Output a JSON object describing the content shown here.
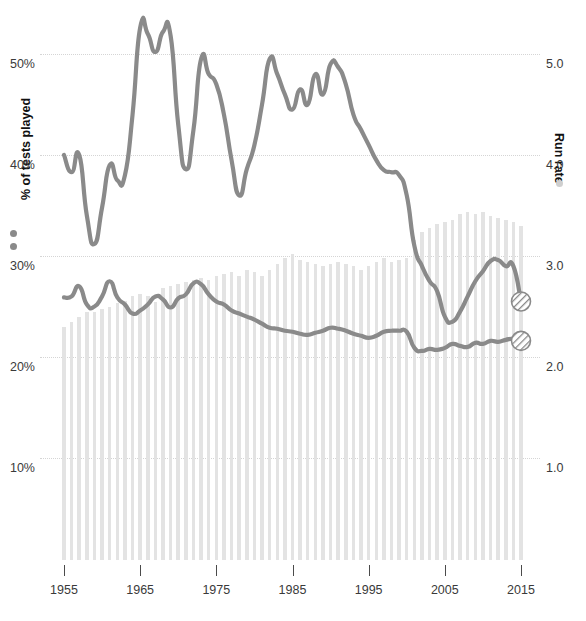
{
  "chart_data": {
    "type": "line",
    "title": "",
    "subtitle": "",
    "xlabel": "",
    "ylabel": "% of tests played",
    "y2label": "Run rate",
    "grid": true,
    "legend_position": "axis-titles",
    "xlim": [
      1955,
      2015
    ],
    "ylim": [
      5,
      55
    ],
    "y2lim": [
      0.5,
      5.4
    ],
    "x_ticks": [
      1955,
      1965,
      1975,
      1985,
      1995,
      2005,
      2015
    ],
    "x_tick_labels": [
      "1955",
      "1965",
      "1975",
      "1985",
      "1995",
      "2005",
      "2015"
    ],
    "y_ticks": [
      10,
      20,
      30,
      40,
      50
    ],
    "y_tick_labels": [
      "10%",
      "20%",
      "30%",
      "40%",
      "50%"
    ],
    "y2_ticks": [
      1.0,
      2.0,
      3.0,
      4.0,
      5.0
    ],
    "y2_tick_labels": [
      "1.0",
      "2.0",
      "3.0",
      "4.0",
      "5.0"
    ],
    "colors": {
      "line": "#8a8a8a",
      "bar": "#e3e3e3",
      "grid": "#d5d5d5",
      "text": "#3a3a3a",
      "axis_title": "#111111",
      "legend_dot_left": "#8a8a8a",
      "legend_dot_right": "#cfcfcf"
    },
    "x": [
      1955,
      1956,
      1957,
      1958,
      1959,
      1960,
      1961,
      1962,
      1963,
      1964,
      1965,
      1966,
      1967,
      1968,
      1969,
      1970,
      1971,
      1972,
      1973,
      1974,
      1975,
      1976,
      1977,
      1978,
      1979,
      1980,
      1981,
      1982,
      1983,
      1984,
      1985,
      1986,
      1987,
      1988,
      1989,
      1990,
      1991,
      1992,
      1993,
      1994,
      1995,
      1996,
      1997,
      1998,
      1999,
      2000,
      2001,
      2002,
      2003,
      2004,
      2005,
      2006,
      2007,
      2008,
      2009,
      2010,
      2011,
      2012,
      2013,
      2014,
      2015
    ],
    "series": [
      {
        "name": "% of tests played",
        "axis": "left",
        "type": "line",
        "unit": "%",
        "end_marker": true,
        "values": [
          40.0,
          38.3,
          40.0,
          34.0,
          31.2,
          34.8,
          39.0,
          37.5,
          38.0,
          44.0,
          52.6,
          52.0,
          50.2,
          52.2,
          51.8,
          43.0,
          38.6,
          42.5,
          49.5,
          48.0,
          47.0,
          44.0,
          39.5,
          36.0,
          38.6,
          41.0,
          45.0,
          49.5,
          48.0,
          46.0,
          44.5,
          46.5,
          45.0,
          48.0,
          46.0,
          49.0,
          48.7,
          47.0,
          44.0,
          42.5,
          41.0,
          39.5,
          38.5,
          38.3,
          38.0,
          36.0,
          31.0,
          29.0,
          27.5,
          26.5,
          24.0,
          23.5,
          24.5,
          26.0,
          27.5,
          28.5,
          29.5,
          29.6,
          29.0,
          29.0,
          25.5
        ]
      },
      {
        "name": "Run rate",
        "axis": "right",
        "type": "line",
        "unit": "runs/over",
        "end_marker": true,
        "values": [
          2.59,
          2.6,
          2.7,
          2.52,
          2.5,
          2.6,
          2.75,
          2.59,
          2.52,
          2.43,
          2.46,
          2.52,
          2.6,
          2.57,
          2.49,
          2.58,
          2.62,
          2.73,
          2.72,
          2.62,
          2.55,
          2.52,
          2.46,
          2.43,
          2.4,
          2.37,
          2.33,
          2.29,
          2.28,
          2.26,
          2.25,
          2.23,
          2.22,
          2.24,
          2.26,
          2.29,
          2.28,
          2.26,
          2.23,
          2.21,
          2.19,
          2.21,
          2.25,
          2.26,
          2.26,
          2.25,
          2.09,
          2.06,
          2.08,
          2.07,
          2.09,
          2.13,
          2.11,
          2.1,
          2.14,
          2.13,
          2.16,
          2.15,
          2.17,
          2.18,
          2.16
        ]
      },
      {
        "name": "Tests played",
        "axis": "bars",
        "type": "bar",
        "unit": "tests",
        "values": [
          23.0,
          23.5,
          24.0,
          24.5,
          24.5,
          24.8,
          25.0,
          25.3,
          25.5,
          26.0,
          26.2,
          26.0,
          25.4,
          26.8,
          27.0,
          27.2,
          27.4,
          27.6,
          27.8,
          27.6,
          28.0,
          28.2,
          28.4,
          28.0,
          28.6,
          28.4,
          28.0,
          28.6,
          29.2,
          29.8,
          30.2,
          29.6,
          29.4,
          29.2,
          29.0,
          29.2,
          29.4,
          29.2,
          29.0,
          28.6,
          29.0,
          29.4,
          29.8,
          29.4,
          29.6,
          29.8,
          31.6,
          32.4,
          32.8,
          33.2,
          33.4,
          33.6,
          34.2,
          34.4,
          34.2,
          34.4,
          34.0,
          33.8,
          33.6,
          33.4,
          33.0
        ]
      }
    ]
  },
  "labels": {
    "left_axis_title": "% of tests played",
    "right_axis_title": "Run rate"
  }
}
